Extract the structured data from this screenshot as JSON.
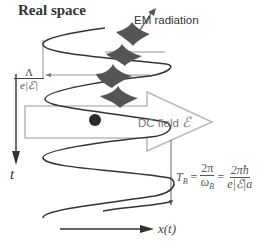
{
  "title": "Real space",
  "labels": {
    "em_radiation": "EM radiation",
    "dc_field": "DC field",
    "dc_field_symbol": "ℰ",
    "time_axis": "t",
    "x_axis": "x(t)"
  },
  "lambda_fraction": {
    "numerator": "Λ",
    "denominator": "e|ℰ|"
  },
  "bloch_period": {
    "lhs": "T",
    "lhs_sub": "B",
    "eq": "=",
    "frac1_num": "2π",
    "frac1_den": "ω",
    "frac1_den_sub": "B",
    "frac2_num": "2πħ",
    "frac2_den": "e|ℰ|a"
  },
  "colors": {
    "curve": "#333333",
    "wavepacket": "#555555",
    "arrow_outline": "#bbbbbb",
    "electron": "#2a2a2a",
    "guide_lines": "#888888"
  }
}
